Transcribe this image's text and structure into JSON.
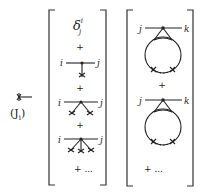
{
  "figure": {
    "source_label": {
      "arrow_icon": "crossed-arrow",
      "text": "(J",
      "subscript": "i",
      "close": ")"
    },
    "left_bracket": {
      "term0": {
        "symbol": "δ",
        "superscript": "i",
        "subscript": "j"
      },
      "plus": "+",
      "terms": [
        {
          "left": "i",
          "right": "j",
          "legs": 1
        },
        {
          "left": "i",
          "right": "j",
          "legs": 2
        },
        {
          "left": "i",
          "right": "j",
          "legs": 3
        }
      ],
      "ellipsis": "+ ..."
    },
    "right_bracket": {
      "terms": [
        {
          "left": "j",
          "right": "k",
          "loop": true
        },
        {
          "left": "j",
          "right": "k",
          "loop": true
        }
      ],
      "plus": "+",
      "ellipsis": "+ ..."
    }
  }
}
